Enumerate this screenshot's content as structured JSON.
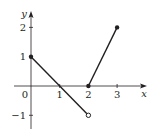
{
  "chart_data": {
    "type": "line",
    "title": "",
    "xlabel": "x",
    "ylabel": "y",
    "xlim": [
      -0.5,
      4
    ],
    "ylim": [
      -1.5,
      2.5
    ],
    "grid": false,
    "legend": null,
    "x_ticks": [
      {
        "value": 0,
        "label": "0"
      },
      {
        "value": 1,
        "label": "1"
      },
      {
        "value": 2,
        "label": "2"
      },
      {
        "value": 3,
        "label": "3"
      }
    ],
    "y_ticks": [
      {
        "value": 2,
        "label": "2"
      },
      {
        "value": 1,
        "label": "1"
      },
      {
        "value": -1,
        "label": "−1"
      }
    ],
    "series": [
      {
        "name": "segment-1",
        "x": [
          0,
          2
        ],
        "y": [
          1,
          -1
        ],
        "endpoints": [
          {
            "x": 0,
            "y": 1,
            "style": "closed"
          },
          {
            "x": 2,
            "y": -1,
            "style": "open"
          }
        ]
      },
      {
        "name": "segment-2",
        "x": [
          2,
          3
        ],
        "y": [
          0,
          2
        ],
        "endpoints": [
          {
            "x": 2,
            "y": 0,
            "style": "closed"
          },
          {
            "x": 3,
            "y": 2,
            "style": "closed"
          }
        ]
      }
    ],
    "colors": {
      "line": "#231f20",
      "axis": "#231f20"
    }
  }
}
